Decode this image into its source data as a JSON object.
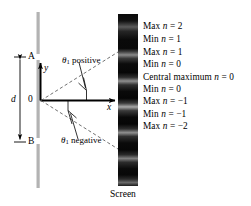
{
  "figure": {
    "screen_caption": "Screen",
    "background_color": "#ffffff",
    "ink_color": "#000000",
    "barrier_color": "#b3b3b3",
    "screen_color": "#0a0a0a",
    "fringe_color": "#8f8f8f"
  },
  "barrier": {
    "slit_a_label": "A",
    "slit_b_label": "B",
    "separation_label": "d"
  },
  "axes": {
    "origin_label": "0",
    "y_axis_label": "y",
    "x_axis_label": "x"
  },
  "angles": {
    "positive": {
      "symbol": "θ",
      "subscript": "1",
      "text": "positive"
    },
    "negative": {
      "symbol": "θ",
      "subscript": "1",
      "text": "negative"
    }
  },
  "fringes": [
    {
      "kind": "Max",
      "order": "2",
      "text": "Max n = 2"
    },
    {
      "kind": "Min",
      "order": "1",
      "text": "Min n = 1"
    },
    {
      "kind": "Max",
      "order": "1",
      "text": "Max n = 1"
    },
    {
      "kind": "Min",
      "order": "0",
      "text": "Min n = 0"
    },
    {
      "kind": "Central maximum",
      "order": "0",
      "text": "Central maximum n = 0"
    },
    {
      "kind": "Min",
      "order": "0",
      "text": "Min n = 0"
    },
    {
      "kind": "Max",
      "order": "−1",
      "text": "Max n = −1"
    },
    {
      "kind": "Min",
      "order": "−1",
      "text": "Min n = −1"
    },
    {
      "kind": "Max",
      "order": "−2",
      "text": "Max n = −2"
    }
  ],
  "chart_data": {
    "type": "diagram",
    "screen_x_px": 118,
    "screen_band": {
      "x": 118,
      "y": 14,
      "width": 20,
      "height": 172
    },
    "bright_fringe_y_px": [
      27,
      52,
      76,
      100,
      124,
      148,
      172
    ],
    "labeled_rows_y_px": [
      27,
      40,
      52,
      64,
      77,
      89,
      101,
      114,
      126
    ],
    "labels": [
      "Max n = 2",
      "Min n = 1",
      "Max n = 1",
      "Min n = 0",
      "Central maximum n = 0",
      "Min n = 0",
      "Max n = −1",
      "Min n = −1",
      "Max n = −2"
    ]
  }
}
